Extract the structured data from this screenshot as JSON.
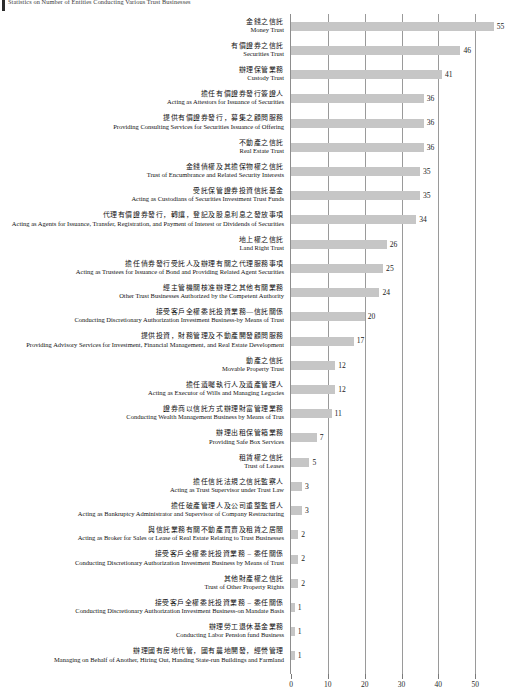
{
  "title": "Statistics on Number of Entities Conducting Various Trust Businesses",
  "axis": {
    "ticks": [
      0,
      10,
      20,
      30,
      40,
      50
    ],
    "xmin": 0,
    "xmax": 57
  },
  "colors": {
    "bar": "#c6c6c6",
    "axis": "#8d8d8d",
    "grid": "#9a9a9a",
    "text": "#111111",
    "title_marker": "#2b2b2b"
  },
  "chart_data": {
    "type": "bar",
    "orientation": "horizontal",
    "title": "Statistics on Number of Entities Conducting Various Trust Businesses",
    "xlabel": "",
    "ylabel": "",
    "xlim": [
      0,
      57
    ],
    "grid": true,
    "legend": "none",
    "tick_labels": [
      "0",
      "10",
      "20",
      "30",
      "40",
      "50"
    ],
    "categories": [
      "金錢之信託 / Money Trust",
      "有價證券之信託 / Securities Trust",
      "辦理保管業務 / Custody Trust",
      "擔任有價證券發行簽證人 / Acting as Attestors for Issuance of Securities",
      "提供有價證券發行、募集之顧問服務 / Providing Consulting Services for Securities Issuance of Offering",
      "不動產之信託 / Real Estate Trust",
      "金錢債權及其擔保物權之信託 / Trust of Encumbrance and Related Security Interests",
      "受託保管證券投資信託基金 / Acting as Custodians of Securities Investment Trust Funds",
      "代理有價證券發行、轉讓、登記及股息利息之發放事項 / Acting as Agents for Issuance, Transfer, Registration, and Payment of Interest or Dividends of Securities",
      "地上權之信託 / Land Right Trust",
      "擔任債券發行受託人及辦理有關之代理服務事項 / Acting as Trustees for Issuance of Bond and Providing Related Agent Securities",
      "經主管機關核准辦理之其他有關業務 / Other Trust Businesses Authorized by the Competent Authority",
      "接受客戶全權委託投資業務—信託關係 / Conducting Discretionary Authorization Investment Business-by Means of Trust",
      "提供投資、財務管理及不動產開發顧問服務 / Providing Advisory Services for Investment, Financial Management, and Real Estate Development",
      "動產之信託 / Movable Property Trust",
      "擔任遺囑執行人及遺產管理人 / Acting as Executor of Wills and Managing Legacies",
      "證券商以信託方式辦理財富管理業務 / Conducting Wealth Management Business by Means of Trus",
      "辦理出租保管箱業務 / Providing Safe Box Services",
      "租賃權之信託 / Trust of Leases",
      "擔任信託法規之信託監察人 / Acting as Trust Supervisor under Trust Law",
      "擔任破產管理人及公司重整監督人 / Acting as Bankruptcy Administrator and Supervisor of Company Restructuring",
      "與信託業務有關不動產買賣及租賃之居間 / Acting as Broker for Sales or Lease of Real Estate Relating to Trust Businesses",
      "接受客戶全權委託投資業務—委任關係 / Conducting Discretionary Authorization Investment Business by Means of Trust",
      "其他財產權之信託 / Trust of Other Property Rights",
      "接受客戶全權委託投資業務—委任關係 / Conducting Discretionary Authorization Investment Business-on Mandate Basis",
      "辦理勞工退休基金業務 / Conducting Labor Pension fund Business",
      "辦理國有房地代管、國有農地開發、經營管理 / Managing on Behalf of Another, Hiring Out, Handing State-run Buildings and Farmland"
    ],
    "values": [
      55,
      46,
      41,
      36,
      36,
      36,
      35,
      35,
      34,
      26,
      25,
      24,
      20,
      17,
      12,
      12,
      11,
      7,
      5,
      3,
      3,
      2,
      2,
      2,
      1,
      1,
      1
    ]
  },
  "rows": [
    {
      "zh": "金錢之信託",
      "en": "Money Trust",
      "value": 55
    },
    {
      "zh": "有價證券之信託",
      "en": "Securities Trust",
      "value": 46
    },
    {
      "zh": "辦理保管業務",
      "en": "Custody Trust",
      "value": 41
    },
    {
      "zh": "擔任有價證券發行簽證人",
      "en": "Acting as Attestors for Issuance of Securities",
      "value": 36
    },
    {
      "zh": "提供有價證券發行，募集之顧問服務",
      "en": "Providing Consulting Services for Securities Issuance of Offering",
      "value": 36
    },
    {
      "zh": "不動產之信託",
      "en": "Real Estate Trust",
      "value": 36
    },
    {
      "zh": "金錢債權及其擔保物權之信託",
      "en": "Trust of Encumbrance and Related Security Interests",
      "value": 35
    },
    {
      "zh": "受託保管證券投資信託基金",
      "en": "Acting as Custodians of Securities Investment Trust Funds",
      "value": 35
    },
    {
      "zh": "代理有價證券發行，轉讓，登記及股息利息之發放事項",
      "en": "Acting as Agents for Issuance, Transfer, Registration, and Payment of Interest or Dividends of Securities",
      "value": 34
    },
    {
      "zh": "地上權之信託",
      "en": "Land Right Trust",
      "value": 26
    },
    {
      "zh": "擔任債券發行受託人及辦理有關之代理服務事項",
      "en": "Acting as Trustees for Issuance of Bond and Providing Related Agent Securities",
      "value": 25
    },
    {
      "zh": "經主管機關核准辦理之其他有關業務",
      "en": "Other Trust Businesses Authorized by the Competent Authority",
      "value": 24
    },
    {
      "zh": "接受客戶全權委託投資業務—信託關係",
      "en": "Conducting Discretionary Authorization Investment Business-by Means of Trust",
      "value": 20
    },
    {
      "zh": "提供投資，財務管理及不動產開發顧問服務",
      "en": "Providing Advisory Services for Investment, Financial Management, and Real Estate Development",
      "value": 17
    },
    {
      "zh": "動產之信託",
      "en": "Movable Property Trust",
      "value": 12
    },
    {
      "zh": "擔任遺囑執行人及遺產管理人",
      "en": "Acting as Executor of Wills and Managing Legacies",
      "value": 12
    },
    {
      "zh": "證券商以信託方式辦理財富管理業務",
      "en": "Conducting Wealth Management Business by Means of Trus",
      "value": 11
    },
    {
      "zh": "辦理出租保管箱業務",
      "en": "Providing Safe Box Services",
      "value": 7
    },
    {
      "zh": "租賃權之信託",
      "en": "Trust of Leases",
      "value": 5
    },
    {
      "zh": "擔任信託法規之信託監察人",
      "en": "Acting as Trust Supervisor under Trust Law",
      "value": 3
    },
    {
      "zh": "擔任破產管理人及公司重整監督人",
      "en": "Acting as Bankruptcy Administrator and Supervisor of Company Restructuring",
      "value": 3
    },
    {
      "zh": "與信託業務有關不動產買賣及租賃之居間",
      "en": "Acting as Broker for Sales or Lease of Real Estate Relating to Trust Businesses",
      "value": 2
    },
    {
      "zh": "接受客戶全權委託投資業務 – 委任關係",
      "en": "Conducting Discretionary Authorization Investment Business by Means of Trust",
      "value": 2
    },
    {
      "zh": "其他財產權之信託",
      "en": "Trust of Other Property Rights",
      "value": 2
    },
    {
      "zh": "接受客戶全權委託投資業務 – 委任關係",
      "en": "Conducting Discretionary Authorization Investment Business-on Mandate Basis",
      "value": 1
    },
    {
      "zh": "辦理勞工退休基金業務",
      "en": "Conducting Labor Pension fund Business",
      "value": 1
    },
    {
      "zh": "辦理國有房地代管，國有農地開發，經營管理",
      "en": "Managing on Behalf of Another, Hiring Out, Handing State-run Buildings and Farmland",
      "value": 1
    }
  ]
}
